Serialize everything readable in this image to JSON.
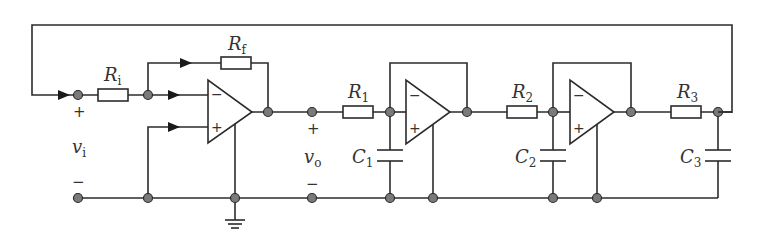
{
  "diagram": {
    "type": "circuit-schematic",
    "labels": {
      "Ri": {
        "main": "R",
        "sub": "i"
      },
      "Rf": {
        "main": "R",
        "sub": "f"
      },
      "R1": {
        "main": "R",
        "sub": "1"
      },
      "R2": {
        "main": "R",
        "sub": "2"
      },
      "R3": {
        "main": "R",
        "sub": "3"
      },
      "C1": {
        "main": "C",
        "sub": "1"
      },
      "C2": {
        "main": "C",
        "sub": "2"
      },
      "C3": {
        "main": "C",
        "sub": "3"
      },
      "vi": {
        "main": "v",
        "sub": "i"
      },
      "vo": {
        "main": "v",
        "sub": "o"
      }
    },
    "signs": {
      "plus": "+",
      "minus": "−"
    }
  }
}
